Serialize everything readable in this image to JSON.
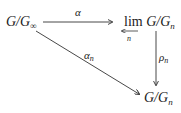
{
  "diagram": {
    "type": "commutative-diagram",
    "nodes": {
      "source": {
        "base": "G/G",
        "sub": "∞"
      },
      "limit": {
        "op": "lim",
        "op_sub": "n",
        "base": "G/G",
        "sub": "n"
      },
      "target": {
        "base": "G/G",
        "sub": "n"
      }
    },
    "arrows": {
      "alpha": {
        "label": "α",
        "from": "source",
        "to": "limit"
      },
      "alpha_n": {
        "label": "α",
        "sub": "n",
        "from": "source",
        "to": "target"
      },
      "rho_n": {
        "label": "ρ",
        "sub": "n",
        "from": "limit",
        "to": "target"
      }
    }
  }
}
